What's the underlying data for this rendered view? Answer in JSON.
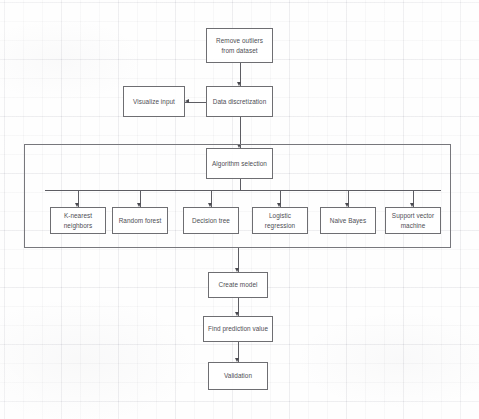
{
  "diagram": {
    "background": "#fefefe",
    "line_color": "#6e6e72",
    "text_color": "#4e4e54"
  },
  "nodes": {
    "remove_outliers": {
      "label": "Remove outliers from dataset",
      "x": 206,
      "y": 28,
      "w": 67,
      "h": 35
    },
    "data_discretization": {
      "label": "Data discretization",
      "x": 206,
      "y": 86,
      "w": 67,
      "h": 31
    },
    "visualize_input": {
      "label": "Visualize input",
      "x": 123,
      "y": 86,
      "w": 62,
      "h": 31
    },
    "algorithm_selection": {
      "label": "Algorithm selection",
      "x": 206,
      "y": 148,
      "w": 67,
      "h": 31
    },
    "create_model": {
      "label": "Create model",
      "x": 208,
      "y": 272,
      "w": 60,
      "h": 26
    },
    "find_prediction_value": {
      "label": "Find prediction value",
      "x": 203,
      "y": 316,
      "w": 70,
      "h": 26
    },
    "validation": {
      "label": "Validation",
      "x": 208,
      "y": 362,
      "w": 60,
      "h": 28
    }
  },
  "algorithm_group": {
    "container": {
      "x": 24,
      "y": 144,
      "w": 427,
      "h": 104
    },
    "bus_line": {
      "x": 45,
      "y": 190,
      "w": 396
    },
    "items": [
      {
        "label": "K-nearest neighbors",
        "x": 50,
        "y": 207,
        "w": 56,
        "h": 27
      },
      {
        "label": "Random forest",
        "x": 112,
        "y": 207,
        "w": 56,
        "h": 27
      },
      {
        "label": "Decision tree",
        "x": 183,
        "y": 207,
        "w": 56,
        "h": 27
      },
      {
        "label": "Logistic regression",
        "x": 252,
        "y": 207,
        "w": 56,
        "h": 27
      },
      {
        "label": "Naive Bayes",
        "x": 320,
        "y": 207,
        "w": 56,
        "h": 27
      },
      {
        "label": "Support vector machine",
        "x": 385,
        "y": 207,
        "w": 56,
        "h": 27
      }
    ]
  },
  "connectors": {
    "remove_to_discretization": "vertical arrow down",
    "discretization_to_visualize": "horizontal arrow left",
    "discretization_to_algorithm": "vertical arrow down",
    "algorithm_to_bus": "vertical line down",
    "bus_to_items": "vertical arrows down",
    "group_to_create_model": "vertical arrow down",
    "create_to_prediction": "vertical arrow down",
    "prediction_to_validation": "vertical arrow down"
  }
}
